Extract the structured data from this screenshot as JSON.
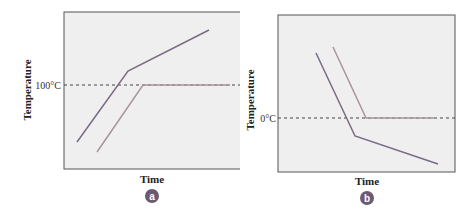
{
  "figure": {
    "panels": [
      {
        "id": "a",
        "badge": "a",
        "ylabel": "Temperature",
        "xlabel": "Time",
        "reference_label": "100°C"
      },
      {
        "id": "b",
        "badge": "b",
        "ylabel": "Temperature",
        "xlabel": "Time",
        "reference_label": "0°C"
      }
    ],
    "colors": {
      "frame_bg": "#efeff0",
      "frame_border": "#555555",
      "line_dark": "#7a6a85",
      "line_light": "#a8969a",
      "badge": "#6b5a72"
    }
  }
}
